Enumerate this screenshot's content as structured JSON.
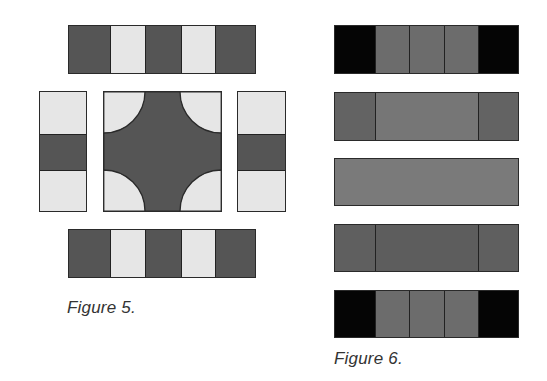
{
  "colors": {
    "dark": "#555555",
    "light": "#e6e6e6",
    "black": "#050505",
    "mid": "#6c6c6c",
    "mid_light": "#7a7a7a",
    "mid_dark": "#5f5f5f",
    "stroke": "#2a2a2a"
  },
  "figure5": {
    "caption": "Figure 5.",
    "top_bar": {
      "segments": [
        "dark",
        "light",
        "dark",
        "light",
        "dark"
      ]
    },
    "bottom_bar": {
      "segments": [
        "dark",
        "light",
        "dark",
        "light",
        "dark"
      ]
    },
    "left_bar": {
      "segments": [
        "light",
        "dark",
        "light"
      ]
    },
    "right_bar": {
      "segments": [
        "light",
        "dark",
        "light"
      ]
    },
    "center_tile": {
      "shape": "cross with quarter-circle light corners",
      "fill": "dark",
      "corner_fill": "light"
    }
  },
  "figure6": {
    "caption": "Figure 6.",
    "bars": [
      {
        "segments": [
          "black",
          "mid",
          "mid",
          "mid",
          "black"
        ]
      },
      {
        "segments": [
          "mid_dark",
          "mid_light",
          "mid_dark"
        ]
      },
      {
        "segments": [
          "mid_light"
        ]
      },
      {
        "segments": [
          "mid_dark",
          "mid_dark",
          "mid_dark"
        ]
      },
      {
        "segments": [
          "black",
          "mid",
          "mid",
          "mid",
          "black"
        ]
      }
    ]
  }
}
